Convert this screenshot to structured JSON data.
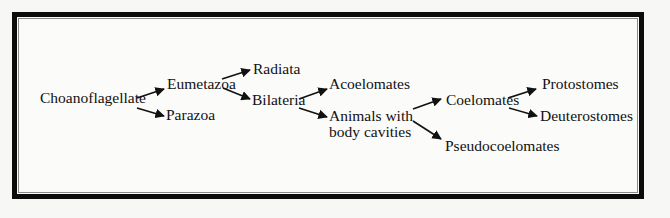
{
  "diagram": {
    "type": "phylogenetic-tree",
    "nodes": {
      "choanoflagellate": "Choanoflagellate",
      "eumetazoa": "Eumetazoa",
      "parazoa": "Parazoa",
      "radiata": "Radiata",
      "bilateria": "Bilateria",
      "acoelomates": "Acoelomates",
      "animals_line1": "Animals with",
      "animals_line2": "body cavities",
      "coelomates": "Coelomates",
      "pseudocoelomates": "Pseudocoelomates",
      "protostomes": "Protostomes",
      "deuterostomes": "Deuterostomes"
    },
    "edges": [
      {
        "from": "Choanoflagellate",
        "to": "Eumetazoa"
      },
      {
        "from": "Choanoflagellate",
        "to": "Parazoa"
      },
      {
        "from": "Eumetazoa",
        "to": "Radiata"
      },
      {
        "from": "Eumetazoa",
        "to": "Bilateria"
      },
      {
        "from": "Bilateria",
        "to": "Acoelomates"
      },
      {
        "from": "Bilateria",
        "to": "Animals with body cavities"
      },
      {
        "from": "Animals with body cavities",
        "to": "Coelomates"
      },
      {
        "from": "Animals with body cavities",
        "to": "Pseudocoelomates"
      },
      {
        "from": "Coelomates",
        "to": "Protostomes"
      },
      {
        "from": "Coelomates",
        "to": "Deuterostomes"
      }
    ],
    "colors": {
      "border": "#0c0c0c",
      "text": "#111111",
      "background": "#fbfbfa"
    }
  }
}
